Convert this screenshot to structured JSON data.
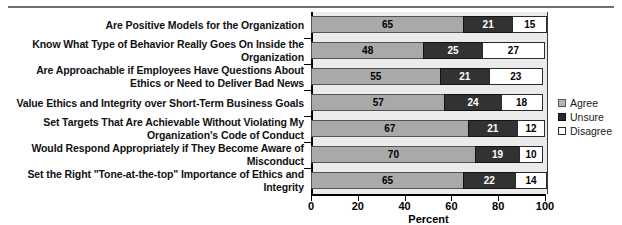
{
  "chart_data": {
    "type": "bar",
    "orientation": "horizontal",
    "stacked": true,
    "title": "",
    "xlabel": "Percent",
    "ylabel": "",
    "xlim": [
      0,
      100
    ],
    "xticks": [
      0,
      20,
      40,
      60,
      80,
      100
    ],
    "grid": false,
    "legend_position": "right",
    "categories": [
      "Are Positive Models for the Organization",
      "Know What Type of Behavior Really Goes On Inside the Organization",
      "Are Approachable if Employees Have Questions About Ethics or Need to Deliver Bad News",
      "Value Ethics and Integrity over Short-Term Business Goals",
      "Set Targets That Are Achievable Without Violating My Organization's Code of Conduct",
      "Would Respond Appropriately if They Become Aware of Misconduct",
      "Set the Right \"Tone-at-the-top\" Importance of Ethics and Integrity"
    ],
    "series": [
      {
        "name": "Agree",
        "color": "#a9a9a9",
        "values": [
          65,
          48,
          55,
          57,
          67,
          70,
          65
        ]
      },
      {
        "name": "Unsure",
        "color": "#323232",
        "values": [
          21,
          25,
          21,
          24,
          21,
          19,
          22
        ]
      },
      {
        "name": "Disagree",
        "color": "#ffffff",
        "values": [
          15,
          27,
          23,
          18,
          12,
          10,
          14
        ]
      }
    ]
  },
  "legend": {
    "items": [
      {
        "label": "Agree"
      },
      {
        "label": "Unsure"
      },
      {
        "label": "Disagree"
      }
    ]
  },
  "axis": {
    "x_title": "Percent",
    "x_tick_labels": [
      "0",
      "20",
      "40",
      "60",
      "80",
      "100"
    ]
  }
}
